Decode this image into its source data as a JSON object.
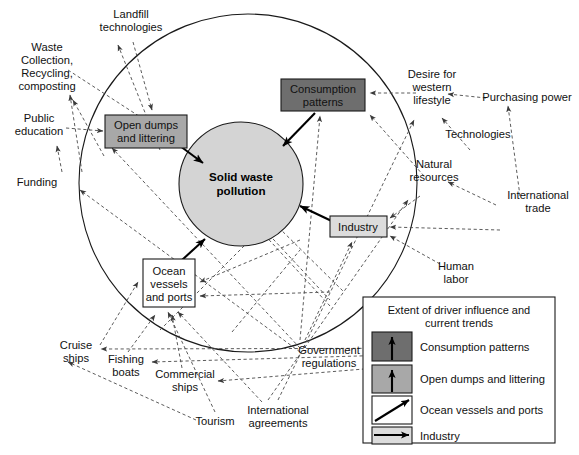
{
  "figure": {
    "type": "driver-influence-diagram",
    "center_node": {
      "id": "solid-waste-pollution",
      "label": "Solid waste\npollution",
      "line1": "Solid waste",
      "line2": "pollution",
      "shape": "circle",
      "fill": "#d4d4d4"
    },
    "system_boundary": {
      "shape": "circle",
      "stroke": "#1a1a1a"
    }
  },
  "inner_drivers": [
    {
      "id": "open-dumps-and-littering",
      "line1": "Open dumps",
      "line2": "and littering",
      "fill": "#a8a8a8",
      "trend": "up"
    },
    {
      "id": "consumption-patterns",
      "line1": "Consumption",
      "line2": "patterns",
      "fill": "#6e6e6e",
      "trend": "up"
    },
    {
      "id": "industry",
      "line1": "Industry",
      "line2": "",
      "fill": "#dcdcdc",
      "trend": "right"
    },
    {
      "id": "ocean-vessels-and-ports",
      "line1": "Ocean",
      "line2": "vessels",
      "line3": "and ports",
      "fill": "#ffffff",
      "trend": "diagonal"
    }
  ],
  "outer_drivers": [
    {
      "id": "landfill-technologies",
      "line1": "Landfill",
      "line2": "technologies"
    },
    {
      "id": "waste-collection-recycling-composting",
      "line1": "Waste",
      "line2": "Collection,",
      "line3": "Recycling,",
      "line4": "composting"
    },
    {
      "id": "public-education",
      "line1": "Public",
      "line2": "education"
    },
    {
      "id": "funding",
      "line1": "Funding",
      "line2": ""
    },
    {
      "id": "desire-for-western-lifestyle",
      "line1": "Desire for",
      "line2": "western",
      "line3": "lifestyle"
    },
    {
      "id": "purchasing-power",
      "line1": "Purchasing power",
      "line2": ""
    },
    {
      "id": "technologies",
      "line1": "Technologies",
      "line2": ""
    },
    {
      "id": "natural-resources",
      "line1": "Natural",
      "line2": "resources"
    },
    {
      "id": "international-trade",
      "line1": "International",
      "line2": "trade"
    },
    {
      "id": "human-labor",
      "line1": "Human",
      "line2": "labor"
    },
    {
      "id": "government-regulations",
      "line1": "Government",
      "line2": "regulations"
    },
    {
      "id": "cruise-ships",
      "line1": "Cruise",
      "line2": "ships"
    },
    {
      "id": "fishing-boats",
      "line1": "Fishing",
      "line2": "boats"
    },
    {
      "id": "commercial-ships",
      "line1": "Commercial",
      "line2": "ships"
    },
    {
      "id": "tourism",
      "line1": "Tourism",
      "line2": ""
    },
    {
      "id": "international-agreements",
      "line1": "International",
      "line2": "agreements"
    }
  ],
  "legend": {
    "title_line1": "Extent of driver influence and",
    "title_line2": "current trends",
    "items": [
      {
        "id": "legend-consumption-patterns",
        "label": "Consumption patterns",
        "swatch_fill": "#6e6e6e",
        "arrow": "up"
      },
      {
        "id": "legend-open-dumps-and-littering",
        "label": "Open dumps and littering",
        "swatch_fill": "#a8a8a8",
        "arrow": "up"
      },
      {
        "id": "legend-ocean-vessels-and-ports",
        "label": "Ocean vessels and ports",
        "swatch_fill": "#ffffff",
        "arrow": "diagonal"
      },
      {
        "id": "legend-industry",
        "label": "Industry",
        "swatch_fill": "#dcdcdc",
        "arrow": "right"
      }
    ]
  },
  "colors": {
    "dark_gray": "#6e6e6e",
    "mid_gray": "#a8a8a8",
    "light_gray": "#dcdcdc",
    "center_fill": "#d4d4d4",
    "line": "#4a4a4a",
    "solid_line": "#000000"
  }
}
